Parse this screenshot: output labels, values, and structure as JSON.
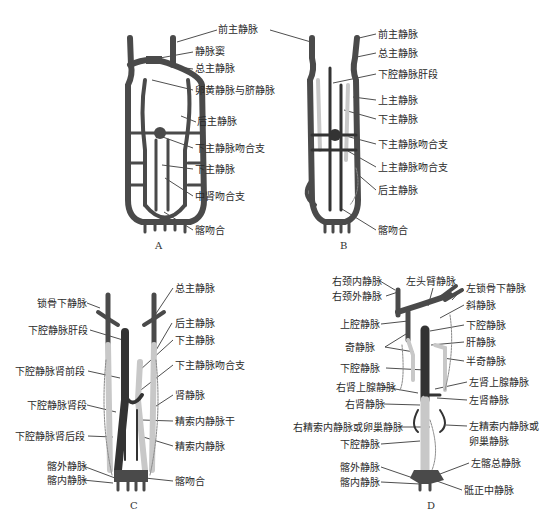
{
  "panels": {
    "A": {
      "letter": "A",
      "labels": [
        "前主静脉",
        "静脉窦",
        "总主静脉",
        "卵黄静脉与脐静脉",
        "后主静脉",
        "下主静脉吻合支",
        "下主静脉",
        "中肾吻合支",
        "髂吻合"
      ]
    },
    "B": {
      "letter": "B",
      "labels": [
        "前主静脉",
        "总主静脉",
        "下腔静脉肝段",
        "上主静脉",
        "下主静脉",
        "下主静脉吻合支",
        "上主静脉吻合支",
        "后主静脉",
        "髂吻合"
      ]
    },
    "C": {
      "letter": "C",
      "labels_left": [
        "锁骨下静脉",
        "下腔静脉肝段",
        "下腔静脉肾前段",
        "下腔静脉肾段",
        "下腔静脉肾后段",
        "髂外静脉",
        "髂内静脉"
      ],
      "labels_right": [
        "总主静脉",
        "后主静脉",
        "下主静脉",
        "下主静脉吻合支",
        "肾静脉",
        "精索内静脉干",
        "精索内静脉",
        "髂吻合"
      ]
    },
    "D": {
      "letter": "D",
      "label_top": "左头臂静脉",
      "labels_left": [
        "右颈内静脉",
        "右颈外静脉",
        "上腔静脉",
        "奇静脉",
        "下腔静脉",
        "右肾上腺静脉",
        "右肾静脉",
        "右精索内静脉或卵巢静脉",
        "下腔静脉",
        "髂外静脉",
        "髂内静脉"
      ],
      "labels_right": [
        "左锁骨下静脉",
        "斜静脉",
        "下腔静脉",
        "肝静脉",
        "半奇静脉",
        "左肾上腺静脉",
        "左肾静脉",
        "左精索内静脉或",
        "卵巢静脉",
        "左髂总静脉",
        "骶正中静脉"
      ]
    }
  },
  "colors": {
    "vein_dark": "#4a4a4a",
    "vein_light": "#c8c8c8",
    "line": "#222222"
  }
}
